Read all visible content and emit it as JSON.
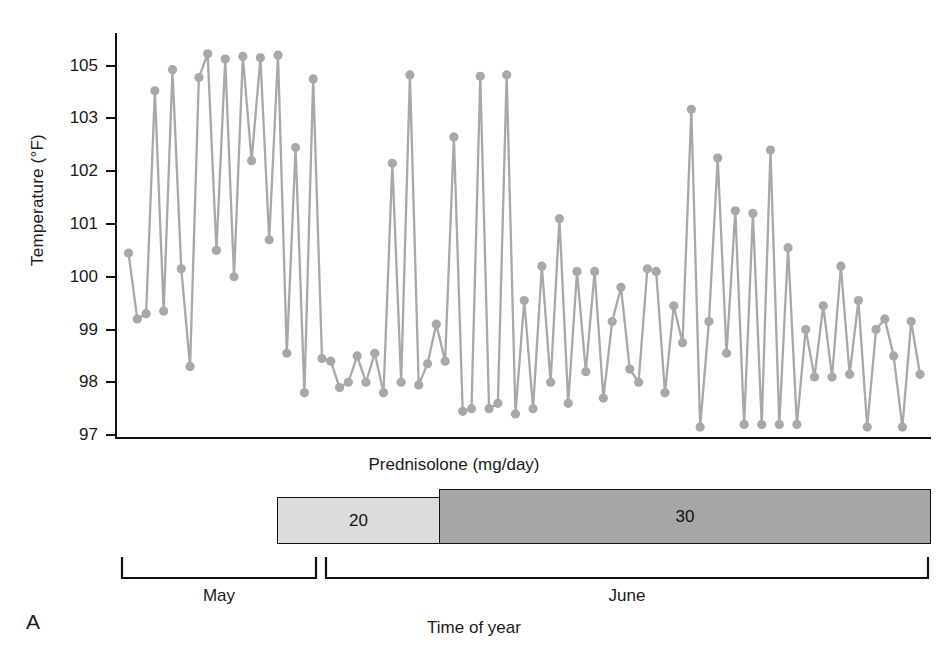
{
  "panel": {
    "letter": "A"
  },
  "axes": {
    "y_title": "Temperature (°F)",
    "y_ticks": [
      "105",
      "103",
      "102",
      "101",
      "100",
      "99",
      "98",
      "97"
    ],
    "x_title": "Time of year"
  },
  "treatment": {
    "title": "Prednisolone (mg/day)",
    "segments": [
      {
        "label": "20",
        "color": "#dcdcdc"
      },
      {
        "label": "30",
        "color": "#a6a6a6"
      }
    ]
  },
  "months": [
    {
      "label": "May"
    },
    {
      "label": "June"
    }
  ],
  "chart_data": {
    "type": "line",
    "title": "",
    "xlabel": "Time of year",
    "ylabel": "Temperature (°F)",
    "ylim": [
      97,
      105.8
    ],
    "ytick_values": [
      105,
      103,
      102,
      101,
      100,
      99,
      98,
      97
    ],
    "ytick_labels": [
      "105",
      "103",
      "102",
      "101",
      "100",
      "99",
      "98",
      "97"
    ],
    "grid": false,
    "legend": "none",
    "marker": "circle",
    "series_color": "#a8a8a8",
    "annotations": [
      {
        "text": "Prednisolone (mg/day)",
        "kind": "secondary-axis-title"
      },
      {
        "text": "20",
        "kind": "dose-bar-segment",
        "span": "days 1-38"
      },
      {
        "text": "30",
        "kind": "dose-bar-segment",
        "span": "days 39-96"
      },
      {
        "text": "May",
        "kind": "month-bracket",
        "span": "days 1-24"
      },
      {
        "text": "June",
        "kind": "month-bracket",
        "span": "days 25-96"
      },
      {
        "text": "A",
        "kind": "panel-letter"
      }
    ],
    "series": [
      {
        "name": "Temperature",
        "values": [
          100.45,
          99.2,
          99.3,
          104.05,
          99.35,
          104.85,
          100.15,
          98.3,
          104.55,
          105.45,
          100.5,
          105.25,
          100.0,
          105.35,
          102.2,
          105.3,
          100.7,
          105.4,
          98.55,
          102.45,
          97.8,
          104.5,
          98.45,
          98.4,
          97.9,
          98.0,
          98.5,
          98.0,
          98.55,
          97.8,
          102.15,
          98.0,
          104.65,
          97.95,
          98.35,
          99.1,
          98.4,
          102.65,
          97.45,
          97.5,
          104.6,
          97.5,
          97.6,
          104.65,
          97.4,
          99.55,
          97.5,
          100.2,
          98.0,
          101.1,
          97.6,
          100.1,
          98.2,
          100.1,
          97.7,
          99.15,
          99.8,
          98.25,
          98.0,
          100.15,
          100.1,
          97.8,
          99.45,
          98.75,
          103.35,
          97.15,
          99.15,
          102.25,
          98.55,
          101.25,
          97.2,
          101.2,
          97.2,
          102.4,
          97.2,
          100.55,
          97.2,
          99.0,
          98.1,
          99.45,
          98.1,
          100.2,
          98.15,
          99.55,
          97.15,
          99.0,
          99.2,
          98.5,
          97.15,
          99.15,
          98.15
        ]
      }
    ]
  }
}
